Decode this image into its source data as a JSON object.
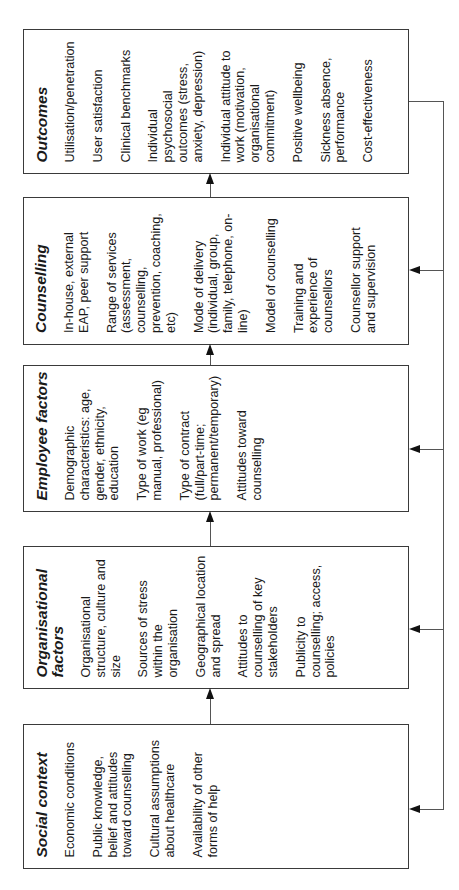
{
  "diagram": {
    "type": "flow",
    "orientation": "rotated-90-ccw",
    "boxes": [
      {
        "id": "outcomes",
        "title": "Outcomes",
        "items": [
          "Utilisation/penetration",
          "User satisfaction",
          "Clinical benchmarks",
          "Individual psychosocial outcomes (stress, anxiety, depression)",
          "Individual attitude to work (motivation, organisational commitment)",
          "Positive wellbeing",
          "Sickness absence, performance",
          "Cost-effectiveness"
        ]
      },
      {
        "id": "counselling",
        "title": "Counselling",
        "items": [
          "In-house, external EAP, peer support",
          "Range of services (assessment, counselling, prevention, coaching, etc)",
          "Mode of delivery (individual, group, family, telephone, on-line)",
          "Model of counselling",
          "Training and experience of counsellors",
          "Counsellor support and supervision"
        ]
      },
      {
        "id": "employee",
        "title": "Employee factors",
        "items": [
          "Demographic characteristics: age, gender, ethnicity, education",
          "Type of work (eg manual, professional)",
          "Type of contract (full/part-time; permanent/temporary)",
          "Attitudes toward counselling"
        ]
      },
      {
        "id": "organisational",
        "title": "Organisational factors",
        "items": [
          "Organisational structure, culture and size",
          "Sources of stress within the organisation",
          "Geographical location and spread",
          "Attitudes to counselling of key stakeholders",
          "Publicity to counselling; access, policies"
        ]
      },
      {
        "id": "social",
        "title": "Social context",
        "items": [
          "Economic conditions",
          "Public knowledge, belief and attitudes toward counselling",
          "Cultural assumptions about healthcare",
          "Availability of other forms of help"
        ]
      }
    ],
    "edges": [
      {
        "from": "social",
        "to": "organisational"
      },
      {
        "from": "organisational",
        "to": "employee"
      },
      {
        "from": "employee",
        "to": "counselling"
      },
      {
        "from": "counselling",
        "to": "outcomes"
      },
      {
        "from": "outcomes",
        "to": "counselling",
        "kind": "feedback"
      },
      {
        "from": "outcomes",
        "to": "employee",
        "kind": "feedback"
      },
      {
        "from": "outcomes",
        "to": "organisational",
        "kind": "feedback"
      },
      {
        "from": "outcomes",
        "to": "social",
        "kind": "feedback"
      }
    ],
    "colors": {
      "border": "#3a3a3a",
      "line": "#555555",
      "arrowhead": "#111111",
      "text": "#1a1a1a"
    }
  }
}
